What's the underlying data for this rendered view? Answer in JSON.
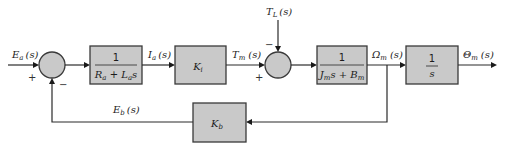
{
  "diagram": {
    "type": "block-diagram",
    "colors": {
      "block_fill": "#c9c9c9",
      "stroke": "#3a3a3a",
      "background": "#ffffff"
    },
    "signals": {
      "input": {
        "main": "E",
        "sub": "a",
        "arg": "(s)"
      },
      "current": {
        "main": "I",
        "sub": "a",
        "arg": "(s)"
      },
      "torque": {
        "main": "T",
        "sub": "m",
        "arg": "(s)"
      },
      "load_torque": {
        "main": "T",
        "sub": "L",
        "arg": "(s)"
      },
      "speed": {
        "main": "Ω",
        "sub": "m",
        "arg": "(s)"
      },
      "position": {
        "main": "Θ",
        "sub": "m",
        "arg": "(s)"
      },
      "back_emf": {
        "main": "E",
        "sub": "b",
        "arg": "(s)"
      }
    },
    "blocks": {
      "armature": {
        "numerator": "1",
        "den_R": "R",
        "den_R_sub": "a",
        "den_plus": " + ",
        "den_L": "L",
        "den_L_sub": "a",
        "den_s": "s"
      },
      "torque_const": {
        "main": "K",
        "sub": "i"
      },
      "mechanical": {
        "numerator": "1",
        "den_J": "J",
        "den_J_sub": "m",
        "den_s_plus": "s + ",
        "den_B": "B",
        "den_B_sub": "m"
      },
      "integrator": {
        "numerator": "1",
        "denominator": "s"
      },
      "back_emf_const": {
        "main": "K",
        "sub": "b"
      }
    },
    "summers": {
      "sum1": {
        "plus": "+",
        "minus": "−"
      },
      "sum2": {
        "plus": "+",
        "minus": "−"
      }
    }
  }
}
